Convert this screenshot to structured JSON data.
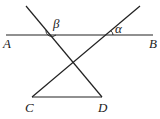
{
  "diagram": {
    "points": {
      "A": {
        "label": "A"
      },
      "B": {
        "label": "B"
      },
      "C": {
        "label": "C"
      },
      "D": {
        "label": "D"
      }
    },
    "angles": {
      "alpha": {
        "label": "α"
      },
      "beta": {
        "label": "β"
      }
    },
    "colors": {
      "line": "#222222",
      "background": "#ffffff"
    }
  }
}
